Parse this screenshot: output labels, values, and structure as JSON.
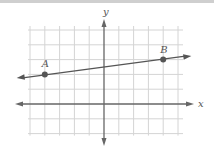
{
  "diagram": {
    "type": "coordinate-plane",
    "axis_labels": {
      "x": "x",
      "y": "y"
    },
    "grid": {
      "x_min": -5,
      "x_max": 5,
      "y_min": -2,
      "y_max": 5,
      "spacing_px": 14.8
    },
    "origin_px": [
      104,
      104
    ],
    "line": {
      "through": [
        "A",
        "B"
      ],
      "extends_both_ways": true
    },
    "points": [
      {
        "label": "A",
        "x": -4,
        "y": 2
      },
      {
        "label": "B",
        "x": 4,
        "y": 3
      }
    ],
    "colors": {
      "grid": "#d4d4d4",
      "axis": "#666666",
      "line": "#555555",
      "point": "#555555",
      "topbar": "#cfcfcf"
    }
  }
}
